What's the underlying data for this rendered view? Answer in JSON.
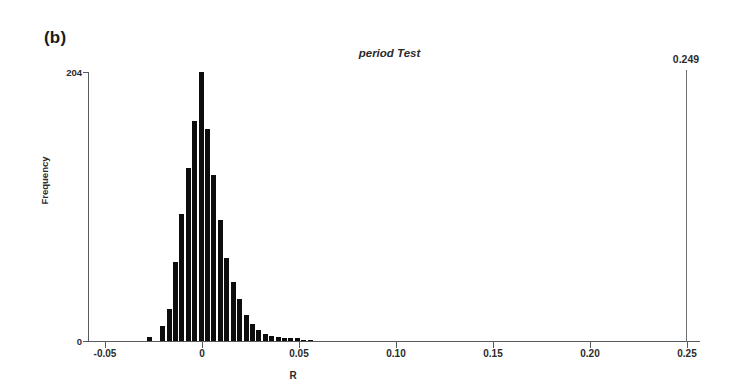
{
  "figure": {
    "panel_label": "(b)",
    "title": "period Test",
    "observed_label": "0.249"
  },
  "axes": {
    "xlabel": "R",
    "ylabel": "Frequency",
    "xticks": [
      "-0.05",
      "0",
      "0.05",
      "0.10",
      "0.15",
      "0.20",
      "0.25"
    ],
    "yticks": [
      "0",
      "204"
    ]
  },
  "colors": {
    "bar": "#0d0d0d",
    "axis": "#555a5e",
    "text": "#2b2b2b",
    "marker": "#6b7074",
    "background": "#ffffff"
  },
  "chart_data": {
    "type": "bar",
    "title": "period Test",
    "xlabel": "R",
    "ylabel": "Frequency",
    "xlim": [
      -0.05,
      0.25
    ],
    "ylim": [
      0,
      204
    ],
    "xticks": [
      -0.05,
      0,
      0.05,
      0.1,
      0.15,
      0.2,
      0.25
    ],
    "yticks": [
      0,
      204
    ],
    "grid": false,
    "legend": null,
    "bin_width": 0.0033,
    "annotations": [
      {
        "label": "0.249",
        "x": 0.249,
        "type": "vertical-line",
        "note": "observed statistic"
      },
      {
        "label": "(b)",
        "type": "panel-label"
      }
    ],
    "bin_centers": [
      -0.0265,
      -0.0232,
      -0.0199,
      -0.0166,
      -0.0133,
      -0.01,
      -0.0067,
      -0.0034,
      -0.0001,
      0.0032,
      0.0065,
      0.0098,
      0.0131,
      0.0164,
      0.0197,
      0.023,
      0.0263,
      0.0296,
      0.0329,
      0.0362,
      0.0395,
      0.0428,
      0.0461,
      0.0494,
      0.0527,
      0.056
    ],
    "values": [
      3,
      0,
      11,
      24,
      60,
      96,
      131,
      167,
      204,
      161,
      126,
      92,
      63,
      45,
      32,
      20,
      13,
      8,
      5,
      4,
      3,
      2,
      2,
      2,
      1,
      1
    ]
  }
}
